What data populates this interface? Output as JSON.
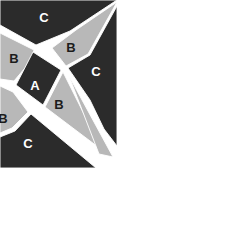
{
  "figure": {
    "background_color": "#ffffff",
    "canvas": {
      "width": 227,
      "height": 252
    },
    "palette": {
      "dark": "#2b2b2b",
      "light_gray": "#b8b8b8",
      "separator": "#ffffff",
      "label_light": "#ffffff",
      "label_dark": "#1c1c1c"
    },
    "pieces": [
      {
        "id": "piece-c-top",
        "label": "C",
        "shade": "dark",
        "label_color": "#ffffff",
        "label_x": 44,
        "label_y": 17,
        "points": "0,0 117,0 70,31 36,45 0,25"
      },
      {
        "id": "piece-b-upper-right",
        "label": "B",
        "shade": "light",
        "label_color": "#1c1c1c",
        "label_x": 71,
        "label_y": 47,
        "points": "117,2 76,30 52,48 66,66 88,54"
      },
      {
        "id": "piece-c-right",
        "label": "C",
        "shade": "dark",
        "label_color": "#ffffff",
        "label_x": 96,
        "label_y": 71,
        "points": "117,6 90,55 68,68 90,100 104,129 117,146"
      },
      {
        "id": "piece-b-left",
        "label": "B",
        "shade": "light",
        "label_color": "#1c1c1c",
        "label_x": 14,
        "label_y": 58,
        "points": "0,33 34,50 30,62 14,81 0,79"
      },
      {
        "id": "piece-a-center",
        "label": "A",
        "shade": "dark",
        "label_color": "#ffffff",
        "label_x": 35,
        "label_y": 85,
        "points": "33,52 61,70 43,105 16,85"
      },
      {
        "id": "piece-b-lower-center",
        "label": "B",
        "shade": "light",
        "label_color": "#1c1c1c",
        "label_x": 59,
        "label_y": 104,
        "points": "63,72 102,150 45,107"
      },
      {
        "id": "piece-b-lower-left",
        "label": "B",
        "shade": "light",
        "label_color": "#1c1c1c",
        "label_x": 3,
        "label_y": 118,
        "points": "0,86 13,92 28,112 12,128 0,133"
      },
      {
        "id": "piece-c-bottom",
        "label": "C",
        "shade": "dark",
        "label_color": "#ffffff",
        "label_x": 28,
        "label_y": 143,
        "points": "0,137 15,131 31,114 96,168 0,168"
      },
      {
        "id": "sliver-lower-right",
        "label": "",
        "shade": "light",
        "label_color": "#1c1c1c",
        "label_x": 0,
        "label_y": 0,
        "points": "69,76 113,157 99,154"
      }
    ],
    "labels_legend": [
      "A",
      "B",
      "C"
    ]
  }
}
